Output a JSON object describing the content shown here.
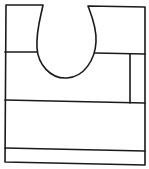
{
  "diagram": {
    "stroke_color": "#1a1a1a",
    "background": "#ffffff",
    "outline": {
      "left_x": 5,
      "right_x": 145,
      "top_y": 5,
      "bottom_left_y": 162,
      "bottom_right_y": 165
    },
    "cutout": {
      "left_top_x": 43,
      "right_top_x": 88,
      "bottom_y": 78,
      "center_x": 67
    },
    "dividers": [
      {
        "name": "upper-divider",
        "y_left": 52,
        "y_right": 54
      },
      {
        "name": "middle-divider",
        "y_left": 100,
        "y_right": 103
      },
      {
        "name": "lower-divider",
        "y_left": 148,
        "y_right": 151
      }
    ],
    "right_partition": {
      "x": 130,
      "y_top": 54,
      "y_bottom": 103
    }
  }
}
